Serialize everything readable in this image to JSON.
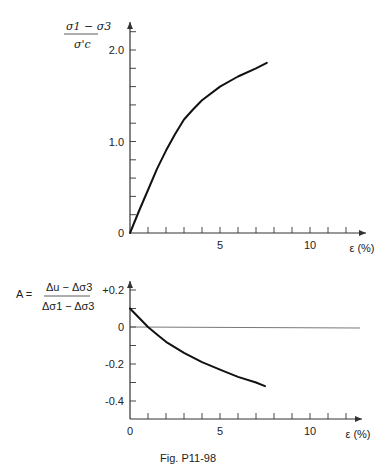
{
  "caption": "Fig. P11-98",
  "chart_data": [
    {
      "type": "line",
      "title": "",
      "ylabel": "(σ1 − σ3) / σ'c",
      "ylabel_numerator": "σ1 − σ3",
      "ylabel_denominator": "σ'c",
      "xlabel": "ε (%)",
      "xlim": [
        0,
        12.5
      ],
      "ylim": [
        0,
        2.2
      ],
      "x_tick_labels": [
        "5",
        "10"
      ],
      "y_tick_labels": [
        "0",
        "1.0",
        "2.0"
      ],
      "x_minor_step": 1,
      "y_minor_step": 0.2,
      "grid": false,
      "series": [
        {
          "name": "deviator stress ratio",
          "x": [
            0,
            0.5,
            1,
            1.5,
            2,
            2.5,
            3,
            3.5,
            4,
            5,
            6,
            7,
            7.6
          ],
          "y": [
            0,
            0.24,
            0.47,
            0.7,
            0.9,
            1.08,
            1.24,
            1.35,
            1.45,
            1.6,
            1.71,
            1.8,
            1.86
          ]
        }
      ]
    },
    {
      "type": "line",
      "title": "",
      "ylabel": "A = (Δu − Δσ3) / (Δσ1 − Δσ3)",
      "ylabel_prefix": "A =",
      "ylabel_numerator": "Δu − Δσ3",
      "ylabel_denominator": "Δσ1 − Δσ3",
      "xlabel": "ε (%)",
      "xlim": [
        0,
        12.5
      ],
      "ylim": [
        -0.5,
        0.25
      ],
      "x_tick_labels": [
        "0",
        "5",
        "10"
      ],
      "y_tick_labels": [
        "+0.2",
        "0",
        "-0.2",
        "-0.4"
      ],
      "x_minor_step": 1,
      "y_minor_step": 0.1,
      "reference_line_y": 0,
      "grid": false,
      "series": [
        {
          "name": "pore pressure parameter A",
          "x": [
            0,
            0.5,
            1,
            1.5,
            2,
            3,
            4,
            5,
            6,
            7,
            7.5
          ],
          "y": [
            0.1,
            0.05,
            0.0,
            -0.04,
            -0.08,
            -0.14,
            -0.19,
            -0.23,
            -0.27,
            -0.3,
            -0.32
          ]
        }
      ]
    }
  ]
}
